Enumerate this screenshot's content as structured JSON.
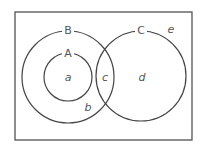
{
  "diagram": {
    "type": "venn",
    "universe": {
      "x": 15,
      "y": 12,
      "width": 177,
      "height": 128,
      "stroke": "#444444"
    },
    "sets": [
      {
        "name": "B",
        "cx": 68,
        "cy": 77,
        "r": 46,
        "label_x": 68,
        "label_y": 30
      },
      {
        "name": "A",
        "cx": 68,
        "cy": 77,
        "r": 24,
        "label_x": 68,
        "label_y": 53
      },
      {
        "name": "C",
        "cx": 141,
        "cy": 76,
        "r": 45,
        "label_x": 141,
        "label_y": 30
      }
    ],
    "regions": [
      {
        "name": "a",
        "x": 68,
        "y": 81
      },
      {
        "name": "b",
        "x": 88,
        "y": 111
      },
      {
        "name": "c",
        "x": 105,
        "y": 81
      },
      {
        "name": "d",
        "x": 142,
        "y": 81
      },
      {
        "name": "e",
        "x": 171,
        "y": 33
      }
    ],
    "colors": {
      "stroke": "#444444",
      "text": "#555555",
      "background": "#ffffff"
    }
  }
}
